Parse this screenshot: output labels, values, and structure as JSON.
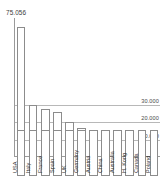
{
  "chart_data": {
    "type": "bar",
    "title": "",
    "xlabel": "",
    "ylabel": "",
    "categories": [
      "USA",
      "Italy",
      "France",
      "Spain",
      "UK",
      "Germany",
      "Austria",
      "China",
      "Australia",
      "H. Kong",
      "Canada",
      "Poland"
    ],
    "values": [
      75056,
      30000,
      27500,
      26000,
      20000,
      16500,
      10600,
      10000,
      7800,
      7600,
      7400,
      7200
    ],
    "ylim": [
      0,
      80000
    ],
    "grid": true,
    "gridlines": [
      {
        "value": 30000,
        "label": "30.000"
      },
      {
        "value": 20000,
        "label": "20.000"
      },
      {
        "value": 10000,
        "label": "10.000"
      }
    ],
    "data_labels": [
      {
        "category": "USA",
        "label": "75.056"
      }
    ],
    "legend": null,
    "legend_position": "none",
    "colors": {
      "bar_fill": "#ffffff",
      "bar_stroke": "#8c8c8c",
      "gridline": "#b8b8b8",
      "axis": "#9a9a9a",
      "text": "#2e2e2e",
      "background": "#ffffff"
    }
  }
}
